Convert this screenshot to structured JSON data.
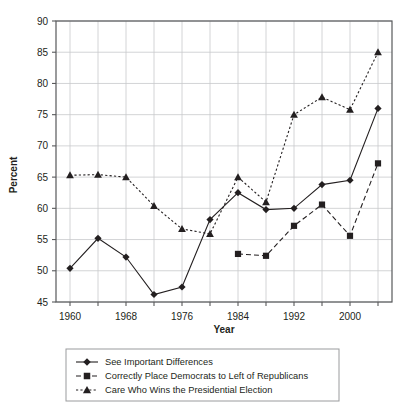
{
  "chart_data": {
    "type": "line",
    "title": "",
    "xlabel": "Year",
    "ylabel": "Percent",
    "xlim": [
      1958,
      2006
    ],
    "ylim": [
      45,
      90
    ],
    "ytick_step": 5,
    "yticks": [
      45,
      50,
      55,
      60,
      65,
      70,
      75,
      80,
      85,
      90
    ],
    "xticks": [
      1960,
      1964,
      1968,
      1972,
      1976,
      1980,
      1984,
      1988,
      1992,
      1996,
      2000,
      2004
    ],
    "xtick_labels": [
      "1960",
      "",
      "1968",
      "",
      "1976",
      "",
      "1984",
      "",
      "1992",
      "",
      "2000",
      ""
    ],
    "grid": true,
    "legend_position": "below",
    "x": [
      1960,
      1964,
      1968,
      1972,
      1976,
      1980,
      1984,
      1988,
      1992,
      1996,
      2000,
      2004
    ],
    "series": [
      {
        "name": "See Important Differences",
        "marker": "diamond",
        "line_style": "solid",
        "color": "#231f20",
        "x": [
          1960,
          1964,
          1968,
          1972,
          1976,
          1980,
          1984,
          1988,
          1992,
          1996,
          2000,
          2004
        ],
        "values": [
          50.4,
          55.2,
          52.2,
          46.2,
          47.4,
          58.2,
          62.5,
          59.8,
          60.0,
          63.8,
          64.5,
          76.0
        ]
      },
      {
        "name": "Correctly Place Democrats to Left of Republicans",
        "marker": "square",
        "line_style": "dashed",
        "color": "#231f20",
        "x": [
          1984,
          1988,
          1992,
          1996,
          2000,
          2004
        ],
        "values": [
          52.7,
          52.4,
          57.2,
          60.6,
          55.6,
          67.2
        ]
      },
      {
        "name": "Care Who Wins the Presidential Election",
        "marker": "triangle",
        "line_style": "dotted",
        "color": "#231f20",
        "x": [
          1960,
          1964,
          1968,
          1972,
          1976,
          1980,
          1984,
          1988,
          1992,
          1996,
          2000,
          2004
        ],
        "values": [
          65.3,
          65.4,
          65.0,
          60.4,
          56.7,
          55.9,
          65.0,
          61.0,
          75.0,
          77.8,
          75.8,
          85.0
        ]
      }
    ]
  },
  "legend": {
    "items": [
      {
        "label": "See Important Differences"
      },
      {
        "label": "Correctly Place Democrats to Left of Republicans"
      },
      {
        "label": "Care Who Wins the Presidential Election"
      }
    ]
  },
  "axes": {
    "y_title": "Percent",
    "x_title": "Year"
  }
}
